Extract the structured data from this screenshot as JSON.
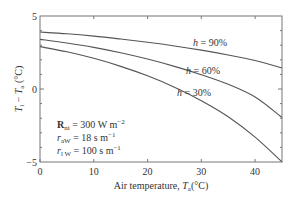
{
  "chart_data": {
    "type": "line",
    "title": "",
    "xlabel": "Air temperature, T_a (°C)",
    "ylabel": "T_l − T_a (°C)",
    "xlim": [
      0,
      45
    ],
    "ylim": [
      -5,
      5
    ],
    "x_ticks": [
      0,
      10,
      20,
      30,
      40
    ],
    "y_ticks": [
      -5,
      0,
      5
    ],
    "x": [
      0,
      5,
      10,
      15,
      20,
      25,
      30,
      35,
      40,
      45
    ],
    "series": [
      {
        "name": "h = 90%",
        "values": [
          3.9,
          3.78,
          3.62,
          3.42,
          3.2,
          2.95,
          2.66,
          2.33,
          1.95,
          1.45
        ]
      },
      {
        "name": "h = 60%",
        "values": [
          3.4,
          3.15,
          2.85,
          2.48,
          2.05,
          1.55,
          0.98,
          0.32,
          -0.55,
          -1.95
        ]
      },
      {
        "name": "h = 30%",
        "values": [
          2.9,
          2.55,
          2.1,
          1.55,
          0.9,
          0.12,
          -0.8,
          -1.9,
          -3.3,
          -5.0
        ]
      }
    ],
    "annotations": [
      "R_ni = 300 W m^-2",
      "r_aW = 18 s m^-1",
      "r_lW = 100 s m^-1"
    ],
    "grid": false,
    "legend": "inline labels"
  },
  "labels": {
    "xlabel_main": "Air temperature, ",
    "xlabel_var": "T",
    "xlabel_sub": "a",
    "xlabel_unit": "(°C)",
    "ylabel_var1": "T",
    "ylabel_sub1": "l",
    "ylabel_minus": " − ",
    "ylabel_var2": "T",
    "ylabel_sub2": "a",
    "ylabel_unit": " (°C)",
    "x_tick_0": "0",
    "x_tick_10": "10",
    "x_tick_20": "20",
    "x_tick_30": "30",
    "x_tick_40": "40",
    "y_tick_5": "5",
    "y_tick_0": "0",
    "y_tick_m5": "−5",
    "curve_90_h": "h",
    "curve_90_rest": " = 90%",
    "curve_60_h": "h",
    "curve_60_rest": " = 60%",
    "curve_30_h": "h",
    "curve_30_rest": " = 30%",
    "annot1_var": "R",
    "annot1_sub": "ni",
    "annot1_rest": " = 300 W m",
    "annot1_exp": "−2",
    "annot2_var": "r",
    "annot2_sub": "aW",
    "annot2_rest": " = 18 s m",
    "annot2_exp": "−1",
    "annot3_var": "r",
    "annot3_sub": "l W",
    "annot3_rest": " = 100 s m",
    "annot3_exp": "−1"
  },
  "colors": {
    "curve": "#555555",
    "frame": "#666666",
    "text": "#333333"
  }
}
